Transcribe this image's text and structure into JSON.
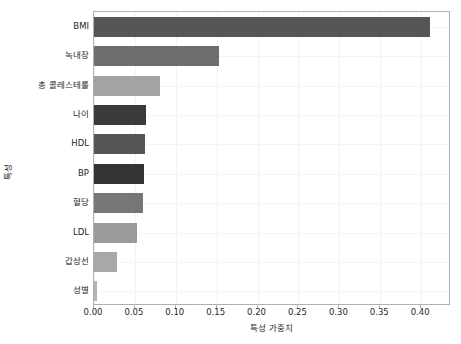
{
  "chart_data": {
    "type": "bar",
    "orientation": "horizontal",
    "title": "",
    "xlabel": "특성 가중치",
    "ylabel": "특성",
    "categories": [
      "BMI",
      "녹내장",
      "총 콜레스테롤",
      "나이",
      "HDL",
      "BP",
      "혈당",
      "LDL",
      "갑상선",
      "성별"
    ],
    "values": [
      0.411,
      0.153,
      0.081,
      0.063,
      0.062,
      0.061,
      0.06,
      0.052,
      0.028,
      0.004
    ],
    "bar_colors": [
      "#565656",
      "#6e6e6e",
      "#a3a3a3",
      "#3b3b3b",
      "#565656",
      "#333333",
      "#777777",
      "#9a9a9a",
      "#a8a8a8",
      "#b4b4b4"
    ],
    "xlim": [
      0.0,
      0.4365
    ],
    "xticks": [
      0.0,
      0.05,
      0.1,
      0.15,
      0.2,
      0.25,
      0.3,
      0.35,
      0.4
    ],
    "xtick_labels": [
      "0.00",
      "0.05",
      "0.10",
      "0.15",
      "0.20",
      "0.25",
      "0.30",
      "0.35",
      "0.40"
    ],
    "grid": true,
    "grid_color": "#f2f2f2",
    "legend": "none",
    "axes_edge_color": "#b0b0b0",
    "background": "#ffffff"
  }
}
